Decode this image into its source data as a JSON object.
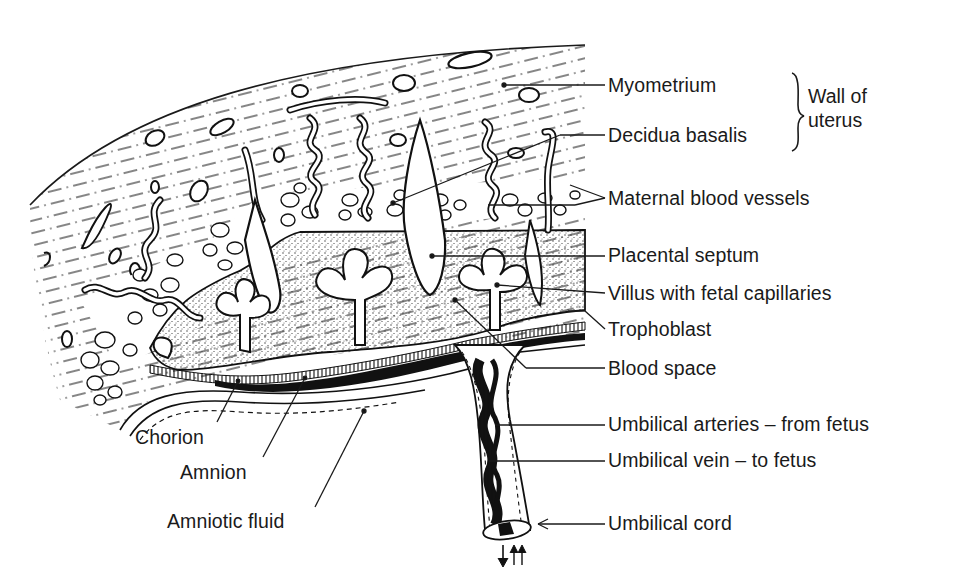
{
  "diagram": {
    "colors": {
      "ink": "#1a1a1a",
      "background": "#ffffff",
      "stipple": "#3a3a3a"
    },
    "right_labels": [
      {
        "id": "myometrium",
        "text": "Myometrium",
        "x": 608,
        "y": 76
      },
      {
        "id": "decidua-basalis",
        "text": "Decidua basalis",
        "x": 608,
        "y": 127
      },
      {
        "id": "maternal-blood-vessels",
        "text": "Maternal blood vessels",
        "x": 608,
        "y": 189
      },
      {
        "id": "placental-septum",
        "text": "Placental septum",
        "x": 608,
        "y": 246
      },
      {
        "id": "villus-with-fetal-capillaries",
        "text": "Villus with fetal capillaries",
        "x": 608,
        "y": 284
      },
      {
        "id": "trophoblast",
        "text": "Trophoblast",
        "x": 608,
        "y": 320
      },
      {
        "id": "blood-space",
        "text": "Blood space",
        "x": 608,
        "y": 359
      },
      {
        "id": "umbilical-arteries",
        "text": "Umbilical arteries – from fetus",
        "x": 608,
        "y": 415
      },
      {
        "id": "umbilical-vein",
        "text": "Umbilical vein – to fetus",
        "x": 608,
        "y": 451
      },
      {
        "id": "umbilical-cord",
        "text": "Umbilical cord",
        "x": 608,
        "y": 514
      }
    ],
    "group_label": {
      "line1": "Wall of",
      "line2": "uterus",
      "x": 808,
      "y": 86
    },
    "left_labels": [
      {
        "id": "chorion",
        "text": "Chorion",
        "x": 135,
        "y": 428
      },
      {
        "id": "amnion",
        "text": "Amnion",
        "x": 180,
        "y": 463
      },
      {
        "id": "amniotic-fluid",
        "text": "Amniotic fluid",
        "x": 167,
        "y": 512
      }
    ]
  }
}
